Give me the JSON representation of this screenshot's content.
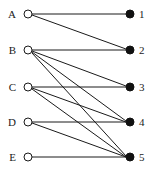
{
  "figure": {
    "width": 158,
    "height": 170,
    "background_color": "#ffffff",
    "line_color": "#1a1a1a",
    "left_node_fill": "#ffffff",
    "right_node_fill": "#111111"
  },
  "left_nodes": [
    {
      "label": "A",
      "x": 28,
      "y": 14,
      "label_x": 16,
      "label_y": 18,
      "radius": 4
    },
    {
      "label": "B",
      "x": 28,
      "y": 50,
      "label_x": 16,
      "label_y": 54,
      "radius": 4
    },
    {
      "label": "C",
      "x": 28,
      "y": 87,
      "label_x": 16,
      "label_y": 91,
      "radius": 4
    },
    {
      "label": "D",
      "x": 28,
      "y": 122,
      "label_x": 16,
      "label_y": 126,
      "radius": 4
    },
    {
      "label": "E",
      "x": 28,
      "y": 157,
      "label_x": 16,
      "label_y": 161,
      "radius": 4
    }
  ],
  "right_nodes": [
    {
      "label": "1",
      "x": 130,
      "y": 14,
      "label_x": 139,
      "label_y": 18,
      "radius": 4
    },
    {
      "label": "2",
      "x": 130,
      "y": 50,
      "label_x": 139,
      "label_y": 54,
      "radius": 4
    },
    {
      "label": "3",
      "x": 130,
      "y": 87,
      "label_x": 139,
      "label_y": 91,
      "radius": 4
    },
    {
      "label": "4",
      "x": 130,
      "y": 122,
      "label_x": 139,
      "label_y": 126,
      "radius": 4
    },
    {
      "label": "5",
      "x": 130,
      "y": 157,
      "label_x": 139,
      "label_y": 161,
      "radius": 4
    }
  ],
  "edges": [
    {
      "from": "A",
      "to": "1",
      "x1": 32,
      "y1": 14,
      "x2": 126,
      "y2": 14
    },
    {
      "from": "A",
      "to": "2",
      "x1": 32,
      "y1": 15,
      "x2": 126,
      "y2": 49
    },
    {
      "from": "B",
      "to": "2",
      "x1": 32,
      "y1": 50,
      "x2": 126,
      "y2": 50
    },
    {
      "from": "B",
      "to": "3",
      "x1": 32,
      "y1": 51,
      "x2": 126,
      "y2": 86
    },
    {
      "from": "B",
      "to": "4",
      "x1": 32,
      "y1": 52,
      "x2": 126,
      "y2": 121
    },
    {
      "from": "B",
      "to": "5",
      "x1": 32,
      "y1": 53,
      "x2": 126,
      "y2": 156
    },
    {
      "from": "C",
      "to": "3",
      "x1": 32,
      "y1": 87,
      "x2": 126,
      "y2": 87
    },
    {
      "from": "C",
      "to": "4",
      "x1": 32,
      "y1": 88,
      "x2": 126,
      "y2": 122
    },
    {
      "from": "C",
      "to": "5",
      "x1": 32,
      "y1": 89,
      "x2": 126,
      "y2": 157
    },
    {
      "from": "D",
      "to": "4",
      "x1": 32,
      "y1": 122,
      "x2": 126,
      "y2": 122
    },
    {
      "from": "D",
      "to": "5",
      "x1": 32,
      "y1": 123,
      "x2": 126,
      "y2": 157
    },
    {
      "from": "E",
      "to": "5",
      "x1": 32,
      "y1": 157,
      "x2": 126,
      "y2": 157
    }
  ]
}
